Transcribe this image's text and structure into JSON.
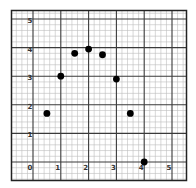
{
  "chart_data": {
    "type": "scatter",
    "title": "",
    "xlabel": "",
    "ylabel": "",
    "xlim": [
      0,
      5.4
    ],
    "ylim": [
      -0.25,
      5.3
    ],
    "grid": true,
    "grid_minor_per_unit": 5,
    "legend": null,
    "x_ticks": [
      "0",
      "1",
      "2",
      "3",
      "4",
      "5"
    ],
    "y_ticks": [
      "0",
      "1",
      "2",
      "3",
      "4",
      "5"
    ],
    "series": [
      {
        "name": "points",
        "color": "#000000",
        "x": [
          0.5,
          1.0,
          1.5,
          2.0,
          2.5,
          3.0,
          3.5,
          4.0
        ],
        "y": [
          1.7,
          3.0,
          3.8,
          3.95,
          3.75,
          2.9,
          1.7,
          0.0
        ]
      }
    ]
  },
  "colors": {
    "background": "#ffffff",
    "border": "#222222",
    "major_grid": "#3a3a3a",
    "minor_grid": "#bdbdbd",
    "point": "#000000"
  }
}
